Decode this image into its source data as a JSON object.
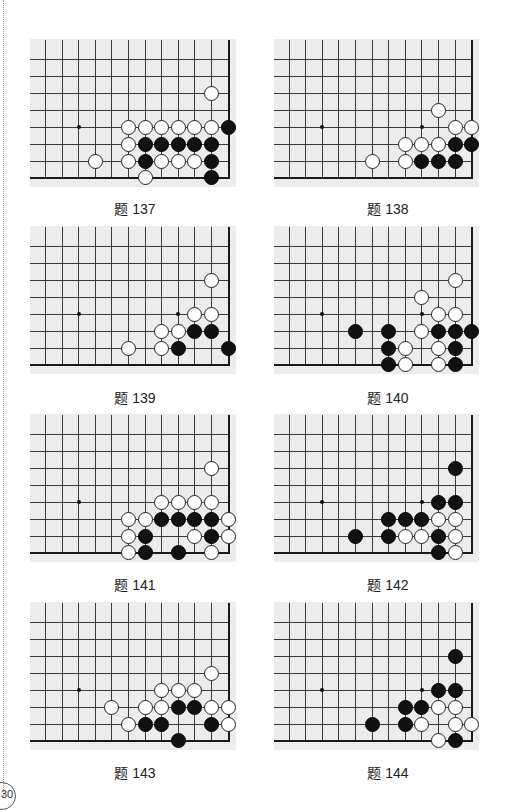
{
  "page": {
    "page_number": "30",
    "colors": {
      "board_bg": "#ececec",
      "line": "#3a3a3a",
      "black": "#111111",
      "white": "#ffffff"
    }
  },
  "board_geometry": {
    "cols": 12,
    "rows": 9,
    "right_edge_col": 11,
    "bottom_edge_row": 8,
    "star_points_note": "col 2 and col 8 on row 5 where visible"
  },
  "problems": [
    {
      "caption": "题 137",
      "stars": [
        [
          2,
          5
        ]
      ],
      "black": [
        [
          11,
          5
        ],
        [
          6,
          6
        ],
        [
          7,
          6
        ],
        [
          8,
          6
        ],
        [
          9,
          6
        ],
        [
          10,
          6
        ],
        [
          6,
          7
        ],
        [
          10,
          7
        ],
        [
          10,
          8
        ]
      ],
      "white": [
        [
          10,
          3
        ],
        [
          5,
          5
        ],
        [
          6,
          5
        ],
        [
          7,
          5
        ],
        [
          8,
          5
        ],
        [
          9,
          5
        ],
        [
          10,
          5
        ],
        [
          5,
          6
        ],
        [
          3,
          7
        ],
        [
          5,
          7
        ],
        [
          7,
          7
        ],
        [
          8,
          7
        ],
        [
          9,
          7
        ],
        [
          6,
          8
        ]
      ]
    },
    {
      "caption": "题 138",
      "stars": [
        [
          2,
          5
        ],
        [
          8,
          5
        ]
      ],
      "black": [
        [
          10,
          6
        ],
        [
          11,
          6
        ],
        [
          8,
          7
        ],
        [
          9,
          7
        ],
        [
          10,
          7
        ]
      ],
      "white": [
        [
          9,
          4
        ],
        [
          10,
          5
        ],
        [
          11,
          5
        ],
        [
          7,
          6
        ],
        [
          8,
          6
        ],
        [
          9,
          6
        ],
        [
          5,
          7
        ],
        [
          7,
          7
        ]
      ]
    },
    {
      "caption": "题 139",
      "stars": [
        [
          2,
          5
        ],
        [
          8,
          5
        ]
      ],
      "black": [
        [
          9,
          6
        ],
        [
          10,
          6
        ],
        [
          8,
          7
        ],
        [
          11,
          7
        ]
      ],
      "white": [
        [
          10,
          3
        ],
        [
          9,
          5
        ],
        [
          10,
          5
        ],
        [
          7,
          6
        ],
        [
          8,
          6
        ],
        [
          5,
          7
        ],
        [
          7,
          7
        ]
      ]
    },
    {
      "caption": "题 140",
      "stars": [
        [
          2,
          5
        ],
        [
          8,
          5
        ]
      ],
      "black": [
        [
          4,
          6
        ],
        [
          6,
          6
        ],
        [
          9,
          6
        ],
        [
          10,
          6
        ],
        [
          11,
          6
        ],
        [
          6,
          7
        ],
        [
          10,
          7
        ],
        [
          6,
          8
        ],
        [
          10,
          8
        ]
      ],
      "white": [
        [
          10,
          3
        ],
        [
          8,
          4
        ],
        [
          9,
          5
        ],
        [
          10,
          5
        ],
        [
          8,
          6
        ],
        [
          7,
          7
        ],
        [
          9,
          7
        ],
        [
          7,
          8
        ],
        [
          9,
          8
        ]
      ]
    },
    {
      "caption": "题 141",
      "stars": [
        [
          2,
          5
        ]
      ],
      "black": [
        [
          7,
          6
        ],
        [
          8,
          6
        ],
        [
          9,
          6
        ],
        [
          10,
          6
        ],
        [
          6,
          7
        ],
        [
          10,
          7
        ],
        [
          6,
          8
        ],
        [
          8,
          8
        ]
      ],
      "white": [
        [
          10,
          3
        ],
        [
          7,
          5
        ],
        [
          8,
          5
        ],
        [
          9,
          5
        ],
        [
          10,
          5
        ],
        [
          5,
          6
        ],
        [
          6,
          6
        ],
        [
          11,
          6
        ],
        [
          5,
          7
        ],
        [
          9,
          7
        ],
        [
          11,
          7
        ],
        [
          5,
          8
        ],
        [
          10,
          8
        ]
      ]
    },
    {
      "caption": "题 142",
      "stars": [
        [
          2,
          5
        ],
        [
          8,
          5
        ]
      ],
      "black": [
        [
          10,
          3
        ],
        [
          9,
          5
        ],
        [
          10,
          5
        ],
        [
          6,
          6
        ],
        [
          7,
          6
        ],
        [
          8,
          6
        ],
        [
          4,
          7
        ],
        [
          6,
          7
        ],
        [
          9,
          7
        ],
        [
          9,
          8
        ]
      ],
      "white": [
        [
          9,
          6
        ],
        [
          10,
          6
        ],
        [
          7,
          7
        ],
        [
          8,
          7
        ],
        [
          10,
          7
        ],
        [
          10,
          8
        ]
      ]
    },
    {
      "caption": "题 143",
      "stars": [
        [
          2,
          5
        ]
      ],
      "black": [
        [
          8,
          6
        ],
        [
          9,
          6
        ],
        [
          6,
          7
        ],
        [
          7,
          7
        ],
        [
          10,
          7
        ],
        [
          8,
          8
        ]
      ],
      "white": [
        [
          10,
          4
        ],
        [
          7,
          5
        ],
        [
          8,
          5
        ],
        [
          9,
          5
        ],
        [
          4,
          6
        ],
        [
          6,
          6
        ],
        [
          7,
          6
        ],
        [
          10,
          6
        ],
        [
          11,
          6
        ],
        [
          5,
          7
        ],
        [
          11,
          7
        ]
      ]
    },
    {
      "caption": "题 144",
      "stars": [
        [
          2,
          5
        ],
        [
          8,
          5
        ]
      ],
      "black": [
        [
          10,
          3
        ],
        [
          9,
          5
        ],
        [
          10,
          5
        ],
        [
          7,
          6
        ],
        [
          8,
          6
        ],
        [
          5,
          7
        ],
        [
          7,
          7
        ],
        [
          10,
          8
        ]
      ],
      "white": [
        [
          9,
          6
        ],
        [
          10,
          6
        ],
        [
          8,
          7
        ],
        [
          10,
          7
        ],
        [
          11,
          7
        ],
        [
          9,
          8
        ]
      ]
    }
  ]
}
